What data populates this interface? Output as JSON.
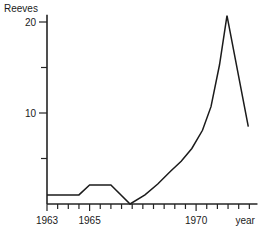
{
  "chart_data": {
    "type": "line",
    "title": "Reeves",
    "xlabel": "year",
    "ylabel": "Reeves",
    "grid": false,
    "legend": null,
    "xlim": [
      1963,
      1972.6
    ],
    "ylim": [
      0,
      20.8
    ],
    "x_tick_labels": [
      {
        "x": 1963,
        "label": "1963"
      },
      {
        "x": 1965,
        "label": "1965"
      },
      {
        "x": 1970,
        "label": "1970"
      }
    ],
    "x_minor_tick_interval": 0.5,
    "x_ticks": [
      1963,
      1963.5,
      1964,
      1964.5,
      1965,
      1965.5,
      1966,
      1966.5,
      1967,
      1967.5,
      1968,
      1968.5,
      1969,
      1969.5,
      1970,
      1970.5,
      1971,
      1971.5,
      1972,
      1972.5
    ],
    "y_tick_labels": [
      {
        "y": 20,
        "label": "20"
      },
      {
        "y": 10,
        "label": "10"
      }
    ],
    "y_ticks": [
      5,
      10,
      15,
      20
    ],
    "axis_unit_label": "year",
    "series": [
      {
        "name": "Reeves",
        "color": "#1b1b1b",
        "points": [
          [
            1963.0,
            1.0
          ],
          [
            1964.5,
            1.0
          ],
          [
            1965.0,
            2.1
          ],
          [
            1966.0,
            2.1
          ],
          [
            1966.9,
            0.0
          ],
          [
            1967.6,
            1.0
          ],
          [
            1968.2,
            2.2
          ],
          [
            1968.8,
            3.6
          ],
          [
            1969.3,
            4.7
          ],
          [
            1969.8,
            6.1
          ],
          [
            1970.3,
            8.1
          ],
          [
            1970.7,
            10.7
          ],
          [
            1971.1,
            15.3
          ],
          [
            1971.45,
            20.7
          ],
          [
            1972.45,
            8.5
          ]
        ]
      }
    ]
  }
}
